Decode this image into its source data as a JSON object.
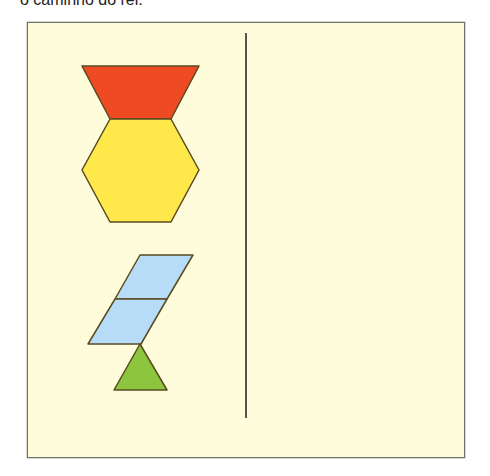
{
  "caption": "o caminho do rei.",
  "colors": {
    "background": "#fffcdc",
    "frame_border": "#6e6e6a",
    "divider": "#55554f",
    "outline": "#5a4a20",
    "trapezoid": "#ee4a24",
    "hexagon": "#ffe84a",
    "rhombus": "#b7dcf7",
    "triangle": "#8cc63f"
  },
  "shapes": [
    {
      "name": "red-trapezoid",
      "type": "trapezoid",
      "points": "82,66 199,66 171,119 110,119"
    },
    {
      "name": "yellow-hexagon",
      "type": "hexagon",
      "points": "110,119 171,119 199,170 171,222 110,222 82,170"
    },
    {
      "name": "blue-rhombus-upper",
      "type": "rhombus",
      "points": "140,255 193,255 167,299 115,299"
    },
    {
      "name": "blue-rhombus-lower",
      "type": "rhombus",
      "points": "115,299 167,299 141,344 88,344"
    },
    {
      "name": "green-triangle",
      "type": "triangle",
      "points": "140,344 167,390 114,390"
    }
  ],
  "divider": {
    "x": 246,
    "y1": 33,
    "y2": 418
  }
}
